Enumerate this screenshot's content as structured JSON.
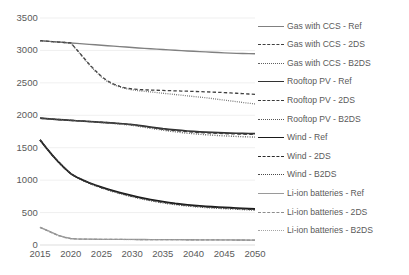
{
  "chart_data": {
    "type": "line",
    "title": "",
    "xlabel": "",
    "ylabel": "",
    "xlim": [
      2015,
      2050
    ],
    "ylim": [
      0,
      3500
    ],
    "grid": true,
    "legend_position": "right",
    "x_ticks": [
      2015,
      2020,
      2025,
      2030,
      2035,
      2040,
      2045,
      2050
    ],
    "y_ticks": [
      0,
      500,
      1000,
      1500,
      2000,
      2500,
      3000,
      3500
    ],
    "x": [
      2015,
      2016,
      2017,
      2018,
      2019,
      2020,
      2021,
      2022,
      2023,
      2024,
      2025,
      2026,
      2027,
      2028,
      2029,
      2030,
      2031,
      2032,
      2033,
      2034,
      2035,
      2036,
      2037,
      2038,
      2039,
      2040,
      2041,
      2042,
      2043,
      2044,
      2045,
      2046,
      2047,
      2048,
      2049,
      2050
    ],
    "series": [
      {
        "name": "Gas with CCS - Ref",
        "style": "solid",
        "color": "#808080",
        "width": 1.4,
        "values": [
          3150,
          3143,
          3136,
          3129,
          3122,
          3115,
          3108,
          3101,
          3094,
          3087,
          3080,
          3073,
          3066,
          3059,
          3052,
          3045,
          3038,
          3032,
          3026,
          3020,
          3014,
          3008,
          3002,
          2997,
          2992,
          2987,
          2982,
          2977,
          2972,
          2967,
          2962,
          2958,
          2955,
          2952,
          2950,
          2948
        ]
      },
      {
        "name": "Gas with CCS - 2DS",
        "style": "dashed",
        "color": "#404040",
        "width": 1.3,
        "values": [
          3150,
          3143,
          3136,
          3129,
          3122,
          3115,
          3010,
          2900,
          2790,
          2690,
          2600,
          2530,
          2480,
          2445,
          2420,
          2405,
          2398,
          2393,
          2389,
          2386,
          2383,
          2380,
          2377,
          2374,
          2371,
          2368,
          2365,
          2362,
          2358,
          2354,
          2350,
          2345,
          2340,
          2334,
          2328,
          2322
        ]
      },
      {
        "name": "Gas with CCS - B2DS",
        "style": "dotted",
        "color": "#606060",
        "width": 1.3,
        "values": [
          3150,
          3143,
          3136,
          3129,
          3122,
          3115,
          3005,
          2890,
          2780,
          2680,
          2590,
          2520,
          2470,
          2435,
          2410,
          2392,
          2380,
          2370,
          2360,
          2350,
          2340,
          2330,
          2320,
          2310,
          2300,
          2290,
          2280,
          2270,
          2258,
          2246,
          2234,
          2222,
          2210,
          2198,
          2186,
          2175
        ]
      },
      {
        "name": "Rooftop PV - Ref",
        "style": "solid",
        "color": "#333333",
        "width": 1.7,
        "values": [
          1955,
          1948,
          1941,
          1934,
          1928,
          1922,
          1916,
          1910,
          1904,
          1898,
          1892,
          1886,
          1880,
          1873,
          1866,
          1858,
          1845,
          1832,
          1819,
          1806,
          1793,
          1783,
          1774,
          1766,
          1758,
          1751,
          1745,
          1740,
          1736,
          1732,
          1729,
          1726,
          1723,
          1721,
          1719,
          1718
        ]
      },
      {
        "name": "Rooftop PV - 2DS",
        "style": "dashed",
        "color": "#3a3a3a",
        "width": 1.4,
        "values": [
          1955,
          1948,
          1941,
          1934,
          1928,
          1922,
          1916,
          1910,
          1904,
          1898,
          1892,
          1886,
          1879,
          1871,
          1863,
          1854,
          1840,
          1826,
          1812,
          1798,
          1785,
          1774,
          1764,
          1755,
          1747,
          1740,
          1734,
          1729,
          1725,
          1721,
          1718,
          1715,
          1712,
          1710,
          1708,
          1706
        ]
      },
      {
        "name": "Rooftop PV - B2DS",
        "style": "dotted",
        "color": "#555555",
        "width": 1.4,
        "values": [
          1955,
          1948,
          1941,
          1934,
          1928,
          1922,
          1916,
          1910,
          1903,
          1896,
          1889,
          1881,
          1873,
          1864,
          1855,
          1845,
          1830,
          1815,
          1800,
          1785,
          1770,
          1757,
          1745,
          1734,
          1724,
          1715,
          1707,
          1700,
          1694,
          1688,
          1683,
          1678,
          1674,
          1670,
          1667,
          1664
        ]
      },
      {
        "name": "Wind - Ref",
        "style": "solid",
        "color": "#1a1a1a",
        "width": 1.8,
        "values": [
          1620,
          1500,
          1385,
          1280,
          1185,
          1100,
          1045,
          1000,
          960,
          925,
          893,
          863,
          835,
          808,
          783,
          760,
          738,
          718,
          700,
          683,
          668,
          654,
          641,
          630,
          620,
          611,
          603,
          596,
          590,
          585,
          580,
          575,
          570,
          565,
          560,
          555
        ]
      },
      {
        "name": "Wind - 2DS",
        "style": "dashed",
        "color": "#2a2a2a",
        "width": 1.4,
        "values": [
          1620,
          1500,
          1385,
          1280,
          1185,
          1100,
          1042,
          996,
          955,
          919,
          886,
          856,
          827,
          800,
          775,
          752,
          730,
          710,
          692,
          675,
          660,
          646,
          633,
          622,
          612,
          603,
          595,
          588,
          582,
          577,
          572,
          567,
          562,
          557,
          552,
          547
        ]
      },
      {
        "name": "Wind - B2DS",
        "style": "dotted",
        "color": "#4a4a4a",
        "width": 1.4,
        "values": [
          1620,
          1500,
          1385,
          1280,
          1185,
          1100,
          1040,
          992,
          950,
          913,
          879,
          848,
          819,
          792,
          767,
          743,
          721,
          701,
          682,
          665,
          649,
          635,
          622,
          611,
          601,
          592,
          584,
          577,
          571,
          566,
          561,
          556,
          551,
          546,
          541,
          536
        ]
      },
      {
        "name": "Li-ion batteries - Ref",
        "style": "solid",
        "color": "#9a9a9a",
        "width": 1.3,
        "values": [
          272,
          232,
          190,
          150,
          120,
          100,
          93,
          91,
          90,
          89,
          88,
          88,
          87,
          87,
          86,
          86,
          85,
          85,
          84,
          84,
          83,
          83,
          82,
          82,
          81,
          81,
          80,
          80,
          79,
          79,
          78,
          78,
          77,
          77,
          76,
          76
        ]
      },
      {
        "name": "Li-ion batteries - 2DS",
        "style": "dashed",
        "color": "#8d8d8d",
        "width": 1.2,
        "values": [
          272,
          230,
          186,
          146,
          117,
          98,
          92,
          90,
          89,
          88,
          87,
          87,
          86,
          86,
          85,
          85,
          84,
          84,
          83,
          83,
          82,
          82,
          81,
          81,
          80,
          80,
          79,
          79,
          78,
          78,
          77,
          77,
          76,
          76,
          75,
          75
        ]
      },
      {
        "name": "Li-ion batteries - B2DS",
        "style": "dotted",
        "color": "#a5a5a5",
        "width": 1.2,
        "values": [
          272,
          228,
          183,
          143,
          114,
          96,
          91,
          89,
          88,
          87,
          86,
          86,
          85,
          85,
          84,
          84,
          83,
          83,
          82,
          82,
          81,
          81,
          80,
          80,
          79,
          79,
          78,
          78,
          77,
          77,
          76,
          76,
          75,
          75,
          74,
          74
        ]
      }
    ]
  },
  "axes": {
    "y_tick_labels": [
      "3500",
      "3000",
      "2500",
      "2000",
      "1500",
      "1000",
      "500",
      "0"
    ],
    "x_tick_labels": [
      "2015",
      "2020",
      "2025",
      "2030",
      "2035",
      "2040",
      "2045",
      "2050"
    ]
  },
  "legend": {
    "items": [
      {
        "label": "Gas with CCS - Ref",
        "style": "solid",
        "color": "#808080"
      },
      {
        "label": "Gas with CCS - 2DS",
        "style": "dashed",
        "color": "#404040"
      },
      {
        "label": "Gas with CCS - B2DS",
        "style": "dotted",
        "color": "#606060"
      },
      {
        "label": "Rooftop PV - Ref",
        "style": "solid",
        "color": "#333333"
      },
      {
        "label": "Rooftop PV - 2DS",
        "style": "dashed",
        "color": "#3a3a3a"
      },
      {
        "label": "Rooftop PV - B2DS",
        "style": "dotted",
        "color": "#555555"
      },
      {
        "label": "Wind - Ref",
        "style": "solid",
        "color": "#1a1a1a"
      },
      {
        "label": "Wind - 2DS",
        "style": "dashed",
        "color": "#2a2a2a"
      },
      {
        "label": "Wind - B2DS",
        "style": "dotted",
        "color": "#4a4a4a"
      },
      {
        "label": "Li-ion batteries - Ref",
        "style": "solid",
        "color": "#9a9a9a"
      },
      {
        "label": "Li-ion batteries - 2DS",
        "style": "dashed",
        "color": "#8d8d8d"
      },
      {
        "label": "Li-ion batteries - B2DS",
        "style": "dotted",
        "color": "#a5a5a5"
      }
    ]
  },
  "style": {
    "grid_color": "#e8e8e8",
    "axis_color": "#d9d9d9",
    "text_color": "#5a5a5a",
    "background": "#ffffff"
  }
}
